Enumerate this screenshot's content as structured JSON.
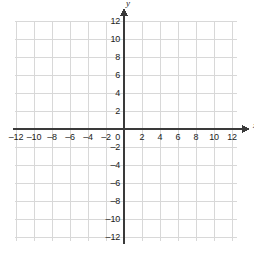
{
  "chart_data": {
    "type": "scatter",
    "title": "",
    "subtitle": "",
    "xlabel": "x",
    "ylabel": "y",
    "xlim": [
      -14,
      13.2
    ],
    "ylim": [
      -13.2,
      13.5
    ],
    "grid": true,
    "grid_step": 2,
    "legend": "none",
    "series": [],
    "annotations": [],
    "origin_label": "0",
    "x_ticks": [
      -12,
      -10,
      -8,
      -6,
      -4,
      -2,
      2,
      4,
      6,
      8,
      10,
      12
    ],
    "x_tick_labels": [
      "‒12",
      "‒10",
      "‒8",
      "‒6",
      "‒4",
      "‒2",
      "2",
      "4",
      "6",
      "8",
      "10",
      "12"
    ],
    "y_ticks": [
      12,
      10,
      8,
      6,
      4,
      2,
      -2,
      -4,
      -6,
      -8,
      -10,
      -12
    ],
    "y_tick_labels": [
      "12",
      "10",
      "8",
      "6",
      "4",
      "2",
      "‒2",
      "‒4",
      "‒6",
      "‒8",
      "‒10",
      "‒12"
    ]
  },
  "style": {
    "background": "#ffffff",
    "grid_color": "#d8d8d8",
    "axis_color": "#3a3a3a",
    "label_color": "#1b1b1b"
  },
  "geometry": {
    "origin_x": 124,
    "origin_y": 129,
    "unit_px": 9,
    "grid_left": 15,
    "grid_right": 237,
    "grid_top": 21,
    "grid_bottom": 241
  }
}
